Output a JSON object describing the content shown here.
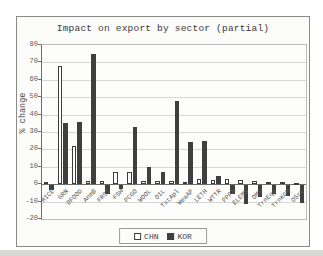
{
  "page": {
    "background": "#ffffff",
    "scan_strip_color": "#d8d8d4"
  },
  "chart_data": {
    "type": "bar",
    "title": "Impact on export by sector (partial)",
    "ylabel": "% change",
    "xlabel": "",
    "ylim": [
      -20,
      80
    ],
    "yticks": [
      80,
      70,
      60,
      50,
      40,
      30,
      20,
      10,
      0,
      -10,
      -20
    ],
    "grid": true,
    "legend_position": "bottom",
    "categories": [
      "RICE",
      "GRN",
      "OFOOD",
      "AnmB",
      "FRST",
      "FSH",
      "PCGO",
      "WOOL",
      "OIL",
      "TxtApl",
      "WeaAP",
      "LETH",
      "WTTR",
      "PPPA",
      "ELEMS",
      "OMF",
      "TrnEqp",
      "TrnKGM",
      "OSrv"
    ],
    "series": [
      {
        "name": "CHN",
        "fill": "#ffffff",
        "stroke": "#3c3c3c",
        "values": [
          1,
          68,
          22,
          2,
          2,
          7,
          7,
          2,
          2,
          2,
          1,
          3,
          2.5,
          3,
          2.5,
          2,
          1.5,
          1,
          0.5
        ]
      },
      {
        "name": "KOR",
        "fill": "#3f3f3f",
        "stroke": "#3f3f3f",
        "values": [
          -3,
          35,
          36,
          75,
          -5,
          -2,
          33,
          10,
          7,
          48,
          24,
          25,
          5,
          -5,
          -11,
          -7,
          -5,
          -6,
          -10
        ]
      }
    ]
  }
}
